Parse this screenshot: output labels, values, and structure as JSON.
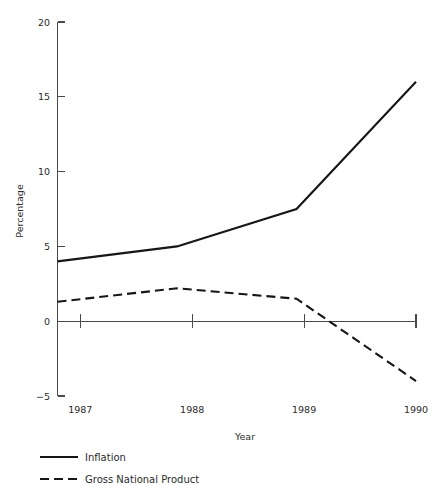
{
  "chart_data": {
    "type": "line",
    "title": "",
    "xlabel": "Year",
    "ylabel": "Percentage",
    "categories": [
      "1987",
      "1988",
      "1989",
      "1990"
    ],
    "x": [
      1987,
      1988,
      1989,
      1990
    ],
    "xlim": [
      1987,
      1990
    ],
    "ylim": [
      -5,
      20
    ],
    "yticks": [
      -5,
      0,
      5,
      10,
      15,
      20
    ],
    "ytick_labels": [
      "−5",
      "0",
      "5",
      "10",
      "15",
      "20"
    ],
    "xtick_labels": [
      "1987",
      "1988",
      "1989",
      "1990"
    ],
    "grid": false,
    "legend_position": "bottom-left",
    "zero_line": 0,
    "series": [
      {
        "name": "Inflation",
        "style": "solid",
        "color": "#161616",
        "values": [
          4,
          5,
          7.5,
          16
        ]
      },
      {
        "name": "Gross National Product",
        "style": "dashed",
        "color": "#161616",
        "values": [
          1.3,
          2.2,
          1.5,
          -4
        ]
      }
    ]
  },
  "axes": {
    "y_title": "Percentage",
    "x_title": "Year",
    "y_tick_0": "20",
    "y_tick_1": "15",
    "y_tick_2": "10",
    "y_tick_3": "5",
    "y_tick_4": "0",
    "y_tick_5": "−5",
    "x_tick_0": "1987",
    "x_tick_1": "1988",
    "x_tick_2": "1989",
    "x_tick_3": "1990"
  },
  "legend": {
    "entries": [
      {
        "label": "Inflation",
        "style": "solid"
      },
      {
        "label": "Gross National Product",
        "style": "dashed"
      }
    ],
    "entry_0_label": "Inflation",
    "entry_1_label": "Gross National Product"
  }
}
